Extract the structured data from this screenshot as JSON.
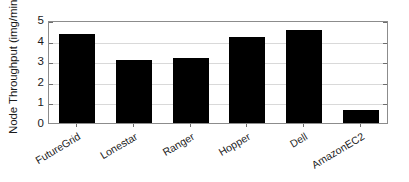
{
  "chart_data": {
    "type": "bar",
    "title": "",
    "xlabel": "",
    "ylabel": "Node Throughput (img/min)",
    "categories": [
      "FutureGrid",
      "Lonestar",
      "Ranger",
      "Hopper",
      "Dell",
      "AmazonEC2"
    ],
    "values": [
      4.32,
      3.06,
      3.16,
      4.17,
      4.52,
      0.63
    ],
    "ylim": [
      0,
      5
    ],
    "yticks": [
      0,
      1,
      2,
      3,
      4,
      5
    ],
    "ytick_labels": [
      "0",
      "1",
      "2",
      "3",
      "4",
      "5"
    ],
    "grid": "horizontal",
    "legend": "none",
    "bar_color": "#000000",
    "grid_color": "#d9d9d9",
    "axis_color": "#8c8c8c",
    "background_color": "#ffffff",
    "series": [
      {
        "name": "Node Throughput",
        "values": [
          4.32,
          3.06,
          3.16,
          4.17,
          4.52,
          0.63
        ]
      }
    ]
  }
}
